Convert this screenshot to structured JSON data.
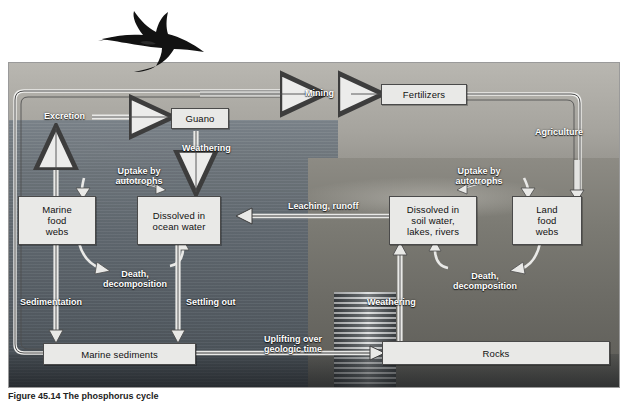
{
  "figure": {
    "caption": "Figure 45.14",
    "title": "The phosphorus cycle"
  },
  "scene": {
    "bird_icon": "frigatebird-icon",
    "photo_alt": "coastal seabird colony, cliffs, waterfall and dry rangeland"
  },
  "nodes": [
    {
      "id": "guano",
      "label": "Guano"
    },
    {
      "id": "fertilizers",
      "label": "Fertilizers"
    },
    {
      "id": "marine-food-webs",
      "label": "Marine\nfood\nwebs"
    },
    {
      "id": "dissolved-ocean",
      "label": "Dissolved in\nocean water"
    },
    {
      "id": "dissolved-soil",
      "label": "Dissolved in\nsoil water,\nlakes, rivers"
    },
    {
      "id": "land-food-webs",
      "label": "Land\nfood\nwebs"
    },
    {
      "id": "marine-sediments",
      "label": "Marine sediments"
    },
    {
      "id": "rocks",
      "label": "Rocks"
    }
  ],
  "flows": [
    {
      "id": "excretion",
      "label": "Excretion"
    },
    {
      "id": "mining",
      "label": "Mining"
    },
    {
      "id": "weathering-guano",
      "label": "Weathering"
    },
    {
      "id": "agriculture",
      "label": "Agriculture"
    },
    {
      "id": "uptake-marine",
      "label": "Uptake by\nautotrophs"
    },
    {
      "id": "uptake-land",
      "label": "Uptake by\nautotrophs"
    },
    {
      "id": "leaching-runoff",
      "label": "Leaching, runoff"
    },
    {
      "id": "death-marine",
      "label": "Death,\ndecomposition"
    },
    {
      "id": "death-land",
      "label": "Death,\ndecomposition"
    },
    {
      "id": "sedimentation",
      "label": "Sedimentation"
    },
    {
      "id": "settling-out",
      "label": "Settling out"
    },
    {
      "id": "weathering-rocks",
      "label": "Weathering"
    },
    {
      "id": "uplifting",
      "label": "Uplifting over\ngeologic time"
    }
  ],
  "colors": {
    "node_fill": "#e9e9e7",
    "node_border": "#4a4a4a",
    "label_text": "#ffffff",
    "arrow_light": "#e6e6e4",
    "arrow_dark": "#3c3c3c",
    "ocean": "#5f676e",
    "land": "#7b7a73"
  }
}
